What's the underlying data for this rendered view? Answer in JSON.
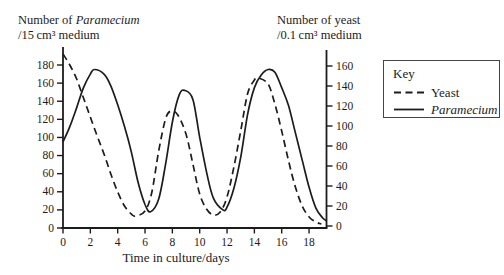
{
  "figure": {
    "title_left": {
      "prefix": "Number of ",
      "italic": "Paramecium",
      "line2": "/15 cm³ medium"
    },
    "title_right": {
      "line1": "Number of yeast",
      "line2": "/0.1 cm³ medium"
    },
    "x_axis_label": "Time in culture/days",
    "key": {
      "title": "Key",
      "items": [
        {
          "style": "dashed",
          "label": "Yeast",
          "italic": false
        },
        {
          "style": "solid",
          "label": "Paramecium",
          "italic": true
        }
      ]
    },
    "colors": {
      "line": "#1c1c1c",
      "text": "#1c1c1c",
      "background": "#ffffff",
      "key_border": "#444444"
    }
  },
  "chart_data": {
    "type": "line",
    "title": "",
    "grid": false,
    "legend": {
      "position": "right",
      "title": "Key",
      "entries": [
        "Yeast",
        "Paramecium"
      ]
    },
    "x": {
      "label": "Time in culture/days",
      "ticks": [
        0,
        2,
        4,
        6,
        8,
        10,
        12,
        14,
        16,
        18
      ],
      "range": [
        0,
        19.3
      ]
    },
    "y_left": {
      "label": "Number of Paramecium /15 cm³ medium",
      "ticks": [
        0,
        20,
        40,
        60,
        80,
        100,
        120,
        140,
        160,
        180
      ],
      "range": [
        0,
        180
      ]
    },
    "y_right": {
      "label": "Number of yeast /0.1 cm³ medium",
      "ticks": [
        0,
        20,
        40,
        60,
        80,
        100,
        120,
        140,
        160
      ],
      "range": [
        0,
        160
      ]
    },
    "series": [
      {
        "name": "Yeast",
        "axis": "right",
        "line_style": "dashed",
        "points": [
          [
            0,
            172
          ],
          [
            0.5,
            161
          ],
          [
            1,
            147
          ],
          [
            1.5,
            128
          ],
          [
            2,
            109
          ],
          [
            2.5,
            90
          ],
          [
            3,
            72
          ],
          [
            3.5,
            52
          ],
          [
            4,
            34
          ],
          [
            4.5,
            20
          ],
          [
            5,
            12
          ],
          [
            5.3,
            10
          ],
          [
            6,
            15
          ],
          [
            6.5,
            34
          ],
          [
            7,
            75
          ],
          [
            7.5,
            107
          ],
          [
            7.9,
            115
          ],
          [
            8.4,
            111
          ],
          [
            9,
            92
          ],
          [
            9.5,
            62
          ],
          [
            10,
            32
          ],
          [
            10.5,
            17
          ],
          [
            11,
            11
          ],
          [
            11.5,
            14
          ],
          [
            12,
            29
          ],
          [
            12.5,
            59
          ],
          [
            13,
            95
          ],
          [
            13.5,
            132
          ],
          [
            14,
            146
          ],
          [
            14.3,
            148
          ],
          [
            15,
            142
          ],
          [
            15.5,
            122
          ],
          [
            16,
            95
          ],
          [
            16.5,
            65
          ],
          [
            17,
            39
          ],
          [
            17.5,
            20
          ],
          [
            18,
            9
          ],
          [
            18.5,
            4
          ],
          [
            18.9,
            2
          ]
        ]
      },
      {
        "name": "Paramecium",
        "axis": "left",
        "line_style": "solid",
        "points": [
          [
            0,
            95
          ],
          [
            0.5,
            112
          ],
          [
            1,
            133
          ],
          [
            1.5,
            155
          ],
          [
            2,
            170
          ],
          [
            2.3,
            175
          ],
          [
            3,
            170
          ],
          [
            3.5,
            157
          ],
          [
            4,
            136
          ],
          [
            4.5,
            112
          ],
          [
            5,
            84
          ],
          [
            5.5,
            50
          ],
          [
            6,
            26
          ],
          [
            6.4,
            18
          ],
          [
            7,
            32
          ],
          [
            7.5,
            70
          ],
          [
            8,
            117
          ],
          [
            8.5,
            147
          ],
          [
            8.9,
            152
          ],
          [
            9.5,
            142
          ],
          [
            10,
            100
          ],
          [
            10.5,
            62
          ],
          [
            11,
            33
          ],
          [
            11.7,
            20
          ],
          [
            12,
            23
          ],
          [
            12.5,
            44
          ],
          [
            13,
            78
          ],
          [
            13.5,
            125
          ],
          [
            14,
            155
          ],
          [
            14.5,
            169
          ],
          [
            15,
            175
          ],
          [
            15.5,
            172
          ],
          [
            16,
            155
          ],
          [
            16.5,
            135
          ],
          [
            17,
            105
          ],
          [
            17.5,
            75
          ],
          [
            18,
            45
          ],
          [
            18.5,
            22
          ],
          [
            19,
            11
          ],
          [
            19.3,
            8
          ]
        ]
      }
    ]
  }
}
